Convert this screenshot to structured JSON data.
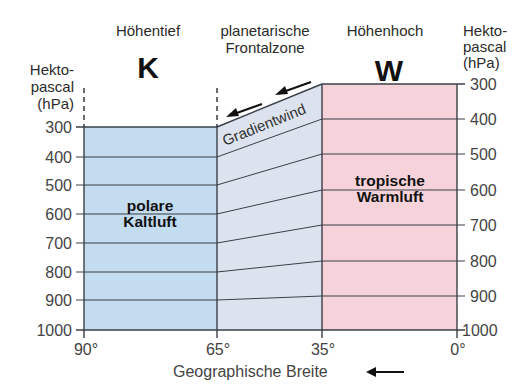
{
  "diagram": {
    "top_cutoff_text": "",
    "headers": {
      "left_low": "Höhentief",
      "front_zone_line1": "planetarische",
      "front_zone_line2": "Frontalzone",
      "right_high": "Höhenhoch"
    },
    "symbols": {
      "cold": "K",
      "warm": "W"
    },
    "left_axis": {
      "title_line1": "Hekto-",
      "title_line2": "pascal",
      "title_line3": "(hPa)",
      "ticks": [
        "300",
        "400",
        "500",
        "600",
        "700",
        "800",
        "900",
        "1000"
      ]
    },
    "right_axis": {
      "title_line1": "Hekto-",
      "title_line2": "pascal",
      "title_line3": "(hPa)",
      "ticks": [
        "300",
        "400",
        "500",
        "600",
        "700",
        "800",
        "900",
        "1000"
      ]
    },
    "x_axis": {
      "ticks": [
        "90°",
        "65°",
        "35°",
        "0°"
      ],
      "label": "Geographische Breite",
      "arrow": "left-arrow"
    },
    "regions": {
      "cold": {
        "line1": "polare",
        "line2": "Kaltluft",
        "color": "#c3dcef"
      },
      "front": {
        "label": "Gradientwind",
        "color": "#dde3ee"
      },
      "warm": {
        "line1": "tropische",
        "line2": "Warmluft",
        "color": "#f6d3da"
      }
    },
    "colors": {
      "line": "#3a3f47",
      "text": "#333333"
    }
  }
}
